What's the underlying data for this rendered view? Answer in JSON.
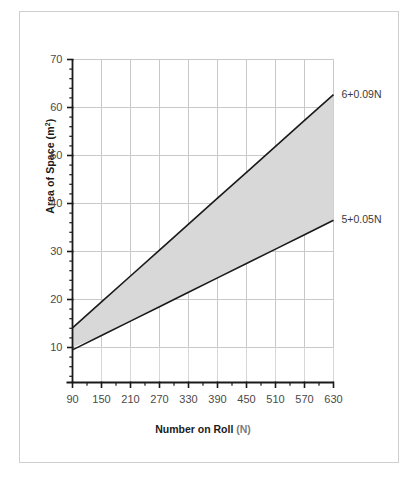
{
  "chart_data": {
    "type": "line",
    "title": "",
    "xlabel": "Number on Roll (N)",
    "xlabel_main": "Number on Roll",
    "xlabel_paren": "(N)",
    "ylabel": "Area of Space (m2)",
    "ylabel_main": "Area of Space (m",
    "ylabel_sup": "2",
    "ylabel_tail": ")",
    "xlim": [
      90,
      630
    ],
    "ylim": [
      0,
      70
    ],
    "x_ticks": [
      90,
      150,
      210,
      270,
      330,
      390,
      450,
      510,
      570,
      630
    ],
    "x_tick_labels": [
      "90",
      "150",
      "210",
      "270",
      "330",
      "390",
      "450",
      "510",
      "570",
      "630"
    ],
    "x_minor_step": 30,
    "y_ticks": [
      10,
      20,
      30,
      40,
      50,
      60,
      70
    ],
    "y_tick_labels": [
      "10",
      "20",
      "30",
      "40",
      "50",
      "60",
      "70"
    ],
    "y_minor_step": 2,
    "grid": true,
    "legend_position": "right-inline-labels",
    "series": [
      {
        "name": "6+0.09N",
        "label": "6+0.09N",
        "intercept": 6,
        "slope": 0.09,
        "x": [
          90,
          150,
          210,
          270,
          330,
          390,
          450,
          510,
          570,
          630
        ],
        "values": [
          14.1,
          19.5,
          24.9,
          30.3,
          35.7,
          41.1,
          46.5,
          51.9,
          57.3,
          62.7
        ],
        "color": "#1a1a1a"
      },
      {
        "name": "5+0.05N",
        "label": "5+0.05N",
        "intercept": 5,
        "slope": 0.05,
        "x": [
          90,
          150,
          210,
          270,
          330,
          390,
          450,
          510,
          570,
          630
        ],
        "values": [
          9.5,
          12.5,
          15.5,
          18.5,
          21.5,
          24.5,
          27.5,
          30.5,
          33.5,
          36.5
        ],
        "color": "#1a1a1a"
      }
    ],
    "shaded_band": {
      "name": "recommended-range-band",
      "between": [
        "5+0.05N",
        "6+0.09N"
      ],
      "color": "#d8d8d8"
    },
    "colors": {
      "grid": "#c9c9c9",
      "axis": "#1a1a1a",
      "tick_text": "#4a4a4a",
      "title_text": "#1a1a1a",
      "band_fill": "#d8d8d8",
      "frame": "#cfcfcf",
      "background": "#ffffff"
    }
  }
}
